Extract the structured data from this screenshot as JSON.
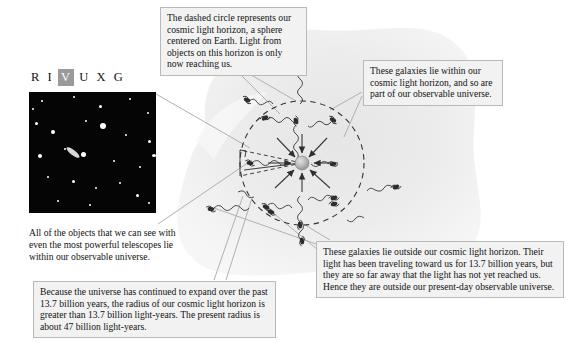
{
  "figure": {
    "type": "astronomy-diagram"
  },
  "wavelength_band": {
    "name": "RIVUXG",
    "letters": [
      "R",
      "I",
      "V",
      "U",
      "X",
      "G"
    ],
    "highlighted": "V",
    "highlight_color": "#9a9a9a"
  },
  "photo": {
    "alt_name": "hubble-deep-field-image",
    "background_color": "#050505"
  },
  "callouts": {
    "horizon": {
      "id": "callout-horizon",
      "text": "The dashed circle represents our cosmic light horizon, a sphere centered on Earth. Light from objects on this horizon is only now reaching us."
    },
    "inside": {
      "id": "callout-inside",
      "text": "These galaxies lie within our cosmic light horizon, and so are part of our observable universe."
    },
    "outside": {
      "id": "callout-outside",
      "text": "These galaxies lie outside our cosmic light horizon. Their light has been traveling toward us for 13.7 billion years, but they are so far away that the light has not yet reached us. Hence they are outside our present-day observable universe."
    },
    "expansion": {
      "id": "callout-expansion",
      "text": "Because the universe has continued to expand over the past 13.7 billion years, the radius of our cosmic light horizon is greater than 13.7 billion light-years. The present radius is about 47 billion light-years."
    },
    "photo_caption": {
      "id": "caption-photo",
      "text": "All of the objects that we can see with even the most powerful telescopes lie within our observable universe."
    }
  },
  "diagram": {
    "center_label": "earth-sphere",
    "circle_style": "dashed",
    "circle_color": "#3a3a3a",
    "blob_color": "#ededed",
    "galaxy_icon": "galaxy-icon",
    "light_ray_icon": "wavy-light-ray",
    "inside_galaxy_count": 8,
    "outside_galaxy_count": 7,
    "radius_marker": "dashed-radius-line"
  }
}
